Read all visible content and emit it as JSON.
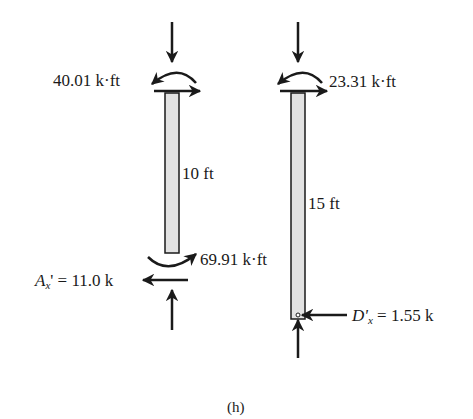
{
  "figure": {
    "caption": "(h)",
    "left_column": {
      "top_moment": "40.01 k·ft",
      "length": "10 ft",
      "bottom_moment": "69.91 k·ft",
      "reaction_symbol": "A",
      "reaction_sub": "x",
      "reaction_value": "' = 11.0 k"
    },
    "right_column": {
      "top_moment": "23.31 k·ft",
      "length": "15 ft",
      "reaction_symbol": "D'",
      "reaction_sub": "x",
      "reaction_value": " = 1.55 k"
    }
  }
}
